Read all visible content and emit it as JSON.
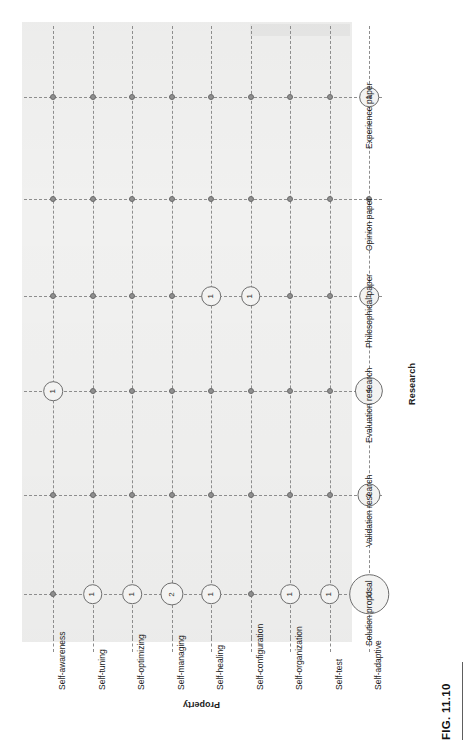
{
  "figure": {
    "caption": "FIG. 11.10",
    "orientation": "rotated-90-ccw"
  },
  "axes": {
    "category_axis_title": "Property",
    "value_axis_title": "Research",
    "categories": [
      "Self-awareness",
      "Self-tuning",
      "Self-optimizing",
      "Self-managing",
      "Self-healing",
      "Self-configuration",
      "Self-organization",
      "Self-test",
      "Self-adaptive"
    ],
    "research_types": [
      "Solution proposal",
      "Validation research",
      "Evaluation research",
      "Philosophical paper",
      "Opinion paper",
      "Experience paper"
    ]
  },
  "chart_data": {
    "type": "scatter",
    "title": "FIG. 11.10",
    "xlabel": "Research",
    "ylabel": "Property",
    "grid": true,
    "legend": "none",
    "note": "Bubble matrix: bubble area encodes the count of papers; a plain grid dot means a count of 0.",
    "categories": [
      "Self-awareness",
      "Self-tuning",
      "Self-optimizing",
      "Self-managing",
      "Self-healing",
      "Self-configuration",
      "Self-organization",
      "Self-test",
      "Self-adaptive"
    ],
    "x": [
      "Solution proposal",
      "Validation research",
      "Evaluation research",
      "Philosophical paper",
      "Opinion paper",
      "Experience paper"
    ],
    "series": [
      {
        "name": "Solution proposal",
        "values": [
          0,
          1,
          1,
          2,
          1,
          0,
          1,
          1,
          11
        ]
      },
      {
        "name": "Validation research",
        "values": [
          0,
          0,
          0,
          0,
          0,
          0,
          0,
          0,
          2
        ]
      },
      {
        "name": "Evaluation research",
        "values": [
          1,
          0,
          0,
          0,
          0,
          0,
          0,
          0,
          4
        ]
      },
      {
        "name": "Philosophical paper",
        "values": [
          0,
          0,
          0,
          0,
          1,
          1,
          0,
          0,
          1
        ]
      },
      {
        "name": "Opinion paper",
        "values": [
          0,
          0,
          0,
          0,
          0,
          0,
          0,
          0,
          0
        ]
      },
      {
        "name": "Experience paper",
        "values": [
          0,
          0,
          0,
          0,
          0,
          0,
          0,
          0,
          1
        ]
      }
    ],
    "bubbles": [
      {
        "category": "Self-tuning",
        "research": "Solution proposal",
        "value": 1
      },
      {
        "category": "Self-optimizing",
        "research": "Solution proposal",
        "value": 1
      },
      {
        "category": "Self-managing",
        "research": "Solution proposal",
        "value": 2
      },
      {
        "category": "Self-healing",
        "research": "Solution proposal",
        "value": 1
      },
      {
        "category": "Self-organization",
        "research": "Solution proposal",
        "value": 1
      },
      {
        "category": "Self-test",
        "research": "Solution proposal",
        "value": 1
      },
      {
        "category": "Self-adaptive",
        "research": "Solution proposal",
        "value": 11
      },
      {
        "category": "Self-adaptive",
        "research": "Validation research",
        "value": 2
      },
      {
        "category": "Self-awareness",
        "research": "Evaluation research",
        "value": 1
      },
      {
        "category": "Self-adaptive",
        "research": "Evaluation research",
        "value": 4
      },
      {
        "category": "Self-healing",
        "research": "Philosophical paper",
        "value": 1
      },
      {
        "category": "Self-configuration",
        "research": "Philosophical paper",
        "value": 1
      },
      {
        "category": "Self-adaptive",
        "research": "Philosophical paper",
        "value": 1
      },
      {
        "category": "Self-adaptive",
        "research": "Experience paper",
        "value": 1
      }
    ]
  },
  "colors": {
    "panel": "#f1f1f0",
    "gridline": "#8d8d8d",
    "bubble_stroke": "#6d6d6d",
    "bubble_fill": "#f3f3f2",
    "zero_marker": "#8f8f8f",
    "text": "#222222",
    "page": "#ffffff"
  }
}
